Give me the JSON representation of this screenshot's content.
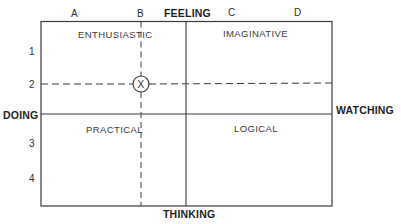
{
  "diagram": {
    "axes": {
      "top": "FEELING",
      "bottom": "THINKING",
      "left": "DOING",
      "right": "WATCHING"
    },
    "columns": [
      "A",
      "B",
      "C",
      "D"
    ],
    "rows": [
      "1",
      "2",
      "3",
      "4"
    ],
    "quadrants": {
      "top_left": "ENTHUSIASTIC",
      "top_right": "IMAGINATIVE",
      "bottom_left": "PRACTICAL",
      "bottom_right": "LOGICAL"
    },
    "marker": {
      "label": "X",
      "column": "B",
      "row": "2"
    },
    "colors": {
      "line": "#3a3a3a",
      "background": "#ffffff"
    }
  }
}
